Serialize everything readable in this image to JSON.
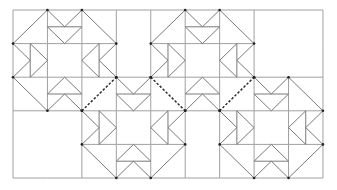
{
  "diagram": {
    "origin": [
      13,
      10
    ],
    "cell_w": 34.44,
    "cell_h": 33.6,
    "cols": 9,
    "rows": 5,
    "colors": {
      "grid": "#a0a0a0",
      "piece": "#7a7a7a",
      "dash": "#333333",
      "dot": "#222222",
      "background": "#ffffff"
    },
    "blocks": [
      {
        "name": "block-1",
        "col": 0,
        "row": 0
      },
      {
        "name": "block-2",
        "col": 4,
        "row": 0
      },
      {
        "name": "block-3",
        "col": 2,
        "row": 2
      },
      {
        "name": "block-4",
        "col": 6,
        "row": 2
      }
    ],
    "empty_regions": [
      {
        "name": "empty-top-gap",
        "col": 3,
        "row": 0,
        "w": 1,
        "h": 2
      },
      {
        "name": "empty-top-right",
        "col": 7,
        "row": 0,
        "w": 2,
        "h": 2
      },
      {
        "name": "empty-bottom-left",
        "col": 0,
        "row": 3,
        "w": 2,
        "h": 2
      },
      {
        "name": "empty-bottom-gap",
        "col": 5,
        "row": 3,
        "w": 1,
        "h": 2
      }
    ],
    "shared_corners": [
      {
        "name": "shared-corner-1",
        "col": 2,
        "row": 2,
        "dir": "up"
      },
      {
        "name": "shared-corner-2",
        "col": 4,
        "row": 2,
        "dir": "down"
      },
      {
        "name": "shared-corner-3",
        "col": 6,
        "row": 2,
        "dir": "up"
      }
    ]
  }
}
